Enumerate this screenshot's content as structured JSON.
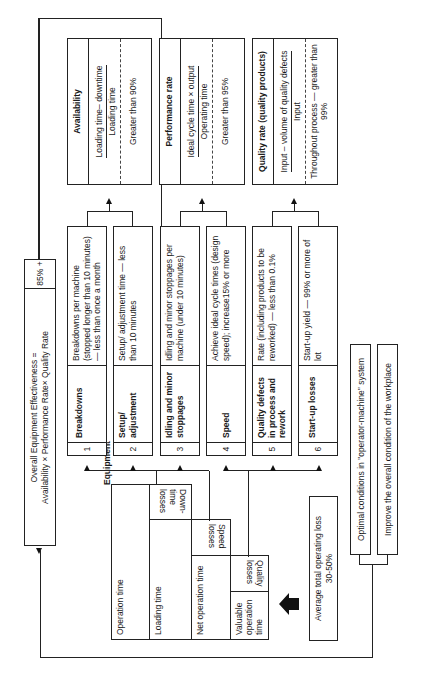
{
  "oee": {
    "formula_line1": "Overall Equipment Effectiveness =",
    "formula_line2": "Availability × Performance Rate× Quality Rate",
    "target": "85% +"
  },
  "equipment": {
    "title": "Equipment",
    "rows": {
      "operation_time": "Operation time",
      "loading_time": "Loading time",
      "net_operation_time": "Net operation time",
      "valuable_operation_time": "Valuable operation time"
    },
    "loss_labels": {
      "down_time": "Down-time losses",
      "speed": "Speed losses",
      "quality": "Quality losses"
    }
  },
  "average_loss": {
    "line1": "Average total operating loss",
    "line2": "30-50%"
  },
  "conditions": [
    "Optimal conditions in \"operator-machine\" system",
    "Improve the overall condition of the workplace"
  ],
  "losses": [
    {
      "num": "1",
      "name": "Breakdowns",
      "target": "Breakdowns per machine (stopped longer than 10 minutes) — less than once a month"
    },
    {
      "num": "2",
      "name": "Setup/ adjustment",
      "target": "Setup/ adjustment time — less than 10 minutes"
    },
    {
      "num": "3",
      "name": "Idling and minor stoppages",
      "target": "Idling and minor stoppages per machine (under 10 minutes)"
    },
    {
      "num": "4",
      "name": "Speed",
      "target": "Achieve ideal cycle times (design speed); increase15% or more"
    },
    {
      "num": "5",
      "name": "Quality defects in process and rework",
      "target": "Rate (including products to be reworked) — less than 0.1%"
    },
    {
      "num": "6",
      "name": "Start-up losses",
      "target": "Start-up yield — 99% or more of lot"
    }
  ],
  "metrics": [
    {
      "title": "Availability",
      "numerator": "Loading time– downtime",
      "denominator": "Loading time",
      "target": "Greater than 90%"
    },
    {
      "title": "Performance rate",
      "numerator": "Ideal cycle time × output",
      "denominator": "Operating time",
      "target": "Greater than 95%"
    },
    {
      "title": "Quality rate (quality products)",
      "numerator": "Input – volume of quality defects",
      "denominator": "Input",
      "target": "Throughout process — greater than 99%"
    }
  ]
}
